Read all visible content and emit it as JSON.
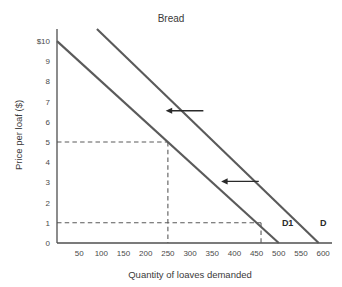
{
  "chart_data": {
    "type": "line",
    "title": "Bread",
    "xlabel": "Quantity of loaves demanded",
    "ylabel": "Price per loaf ($)",
    "xlim": [
      0,
      620
    ],
    "ylim": [
      0,
      10.6
    ],
    "grid": false,
    "legend_position": "inline-end-of-line",
    "xticks": [
      50,
      100,
      150,
      200,
      250,
      300,
      350,
      400,
      450,
      500,
      550,
      600
    ],
    "xtick_labels": [
      "50",
      "100",
      "150",
      "200",
      "250",
      "300",
      "350",
      "400",
      "450",
      "500",
      "550",
      "600"
    ],
    "yticks": [
      0,
      1,
      2,
      3,
      4,
      5,
      6,
      7,
      8,
      9,
      10
    ],
    "ytick_labels": [
      "0",
      "1",
      "2",
      "3",
      "4",
      "5",
      "6",
      "7",
      "8",
      "9",
      "$10"
    ],
    "series": [
      {
        "name": "D",
        "label": "D",
        "label_x": 600,
        "label_y": 0.82,
        "points": [
          {
            "x": 90,
            "y": 10.6
          },
          {
            "x": 590,
            "y": 0.0
          }
        ],
        "x_intercept": 590,
        "note": "original demand curve"
      },
      {
        "name": "D1",
        "label": "D1",
        "label_x": 520,
        "label_y": 0.82,
        "points": [
          {
            "x": 0,
            "y": 10.0
          },
          {
            "x": 500,
            "y": 0.0
          }
        ],
        "y_intercept": 10,
        "x_intercept": 500,
        "note": "shifted-left demand curve"
      }
    ],
    "guide_lines": [
      {
        "name": "price-5-guide",
        "price": 5,
        "quantity": 250,
        "style": "dashed"
      },
      {
        "name": "price-1-guide",
        "price": 1,
        "quantity": 460,
        "style": "dashed"
      }
    ],
    "annotations": [
      {
        "name": "shift-arrow-upper",
        "type": "arrow",
        "direction": "left",
        "x_from": 330,
        "x_to": 245,
        "y": 6.55
      },
      {
        "name": "shift-arrow-lower",
        "type": "arrow",
        "direction": "left",
        "x_from": 455,
        "x_to": 370,
        "y": 3.05
      }
    ],
    "colors": {
      "curve": "#5a5a5a",
      "axis": "#4f4f4f",
      "text": "#3a3a3a",
      "arrow": "#2a2a2a",
      "background": "#ffffff"
    }
  }
}
